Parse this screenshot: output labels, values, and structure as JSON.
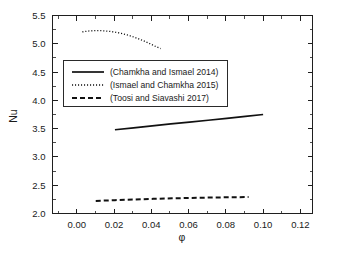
{
  "chart_data": {
    "type": "line",
    "title": "",
    "xlabel": "φ",
    "ylabel": "Nu",
    "xlim": [
      -0.013,
      0.1265
    ],
    "ylim": [
      2.0,
      5.5
    ],
    "grid": false,
    "legend_position": "upper-left-inside",
    "xticks": [
      "0.00",
      "0.02",
      "0.04",
      "0.06",
      "0.08",
      "0.10",
      "0.12"
    ],
    "xtick_values": [
      0.0,
      0.02,
      0.04,
      0.06,
      0.08,
      0.1,
      0.12
    ],
    "yticks": [
      "2.0",
      "2.5",
      "3.0",
      "3.5",
      "4.0",
      "4.5",
      "5.0",
      "5.5"
    ],
    "ytick_values": [
      2.0,
      2.5,
      3.0,
      3.5,
      4.0,
      4.5,
      5.0,
      5.5
    ],
    "series": [
      {
        "name": "(Chamkha and Ismael 2014)",
        "style": "solid",
        "color": "#111111",
        "x": [
          0.0205,
          0.0305,
          0.0405,
          0.0505,
          0.0605,
          0.0705,
          0.0805,
          0.0905,
          0.1
        ],
        "values": [
          3.48,
          3.515,
          3.55,
          3.583,
          3.615,
          3.648,
          3.681,
          3.716,
          3.75
        ]
      },
      {
        "name": "(Ismael and Chamkha 2015)",
        "style": "dotted",
        "color": "#111111",
        "x": [
          0.003,
          0.006,
          0.009,
          0.012,
          0.015,
          0.018,
          0.021,
          0.024,
          0.027,
          0.03,
          0.033,
          0.036,
          0.039,
          0.042,
          0.045
        ],
        "values": [
          5.21,
          5.225,
          5.232,
          5.233,
          5.228,
          5.218,
          5.203,
          5.183,
          5.157,
          5.126,
          5.09,
          5.05,
          5.005,
          4.958,
          4.915
        ]
      },
      {
        "name": "(Toosi and Siavashi 2017)",
        "style": "dashed",
        "color": "#111111",
        "x": [
          0.0102,
          0.0205,
          0.0307,
          0.041,
          0.0512,
          0.0615,
          0.0717,
          0.082,
          0.0922
        ],
        "values": [
          2.222,
          2.236,
          2.248,
          2.259,
          2.268,
          2.276,
          2.282,
          2.287,
          2.29
        ]
      }
    ]
  },
  "legend": {
    "entries": [
      {
        "label": "(Chamkha and Ismael 2014)",
        "style": "solid"
      },
      {
        "label": "(Ismael and Chamkha 2015)",
        "style": "dotted"
      },
      {
        "label": "(Toosi and Siavashi 2017)",
        "style": "dashed"
      }
    ]
  }
}
